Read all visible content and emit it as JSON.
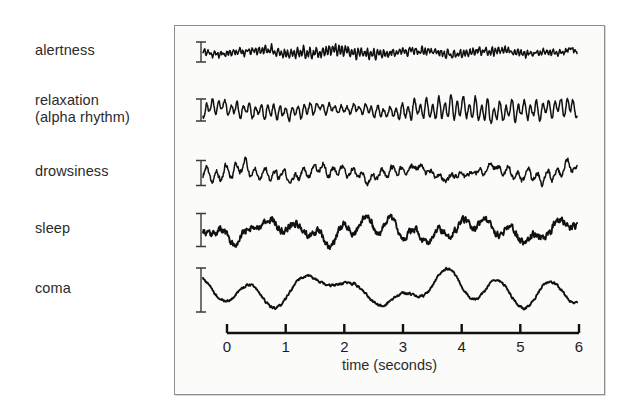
{
  "figure": {
    "background_color": "#ffffff",
    "panel_background_color": "#fbfbfa",
    "panel_border_color": "#8d8d8d",
    "trace_color": "#111111"
  },
  "axis": {
    "label": "time (seconds)",
    "tick_labels": [
      "0",
      "1",
      "2",
      "3",
      "4",
      "5",
      "6"
    ],
    "tick_values": [
      0,
      1,
      2,
      3,
      4,
      5,
      6
    ],
    "min": 0,
    "max": 6,
    "units": "seconds",
    "axis_color": "#111111"
  },
  "traces": [
    {
      "label": "alertness",
      "scale_bar_height_px": 20,
      "baseline_y": 52,
      "amplitude": 7,
      "frequency": 19.5,
      "noise": 0.55,
      "slow_amplitude": 1.6,
      "slow_frequency": 0.8,
      "seed": 11
    },
    {
      "label": "relaxation\n(alpha rhythm)",
      "scale_bar_height_px": 22,
      "baseline_y": 110,
      "amplitude": 17,
      "frequency": 10.2,
      "noise": 0.22,
      "slow_amplitude": 2.2,
      "slow_frequency": 0.55,
      "seed": 23
    },
    {
      "label": "drowsiness",
      "scale_bar_height_px": 25,
      "baseline_y": 173,
      "amplitude": 11,
      "frequency": 6.4,
      "noise": 0.45,
      "slow_amplitude": 4.5,
      "slow_frequency": 0.75,
      "seed": 37
    },
    {
      "label": "sleep",
      "scale_bar_height_px": 33,
      "baseline_y": 230,
      "amplitude": 15,
      "frequency": 2.6,
      "noise": 0.42,
      "slow_amplitude": 7,
      "slow_frequency": 0.62,
      "seed": 53
    },
    {
      "label": "coma",
      "scale_bar_height_px": 44,
      "baseline_y": 290,
      "amplitude": 23,
      "frequency": 1.25,
      "noise": 0.1,
      "slow_amplitude": 9,
      "slow_frequency": 0.45,
      "seed": 71
    }
  ],
  "chart_data": {
    "type": "line",
    "xlabel": "time (seconds)",
    "ylabel": "",
    "xlim": [
      0,
      6
    ],
    "grid": false,
    "legend_position": "left-labels",
    "x_tick_labels": [
      "0",
      "1",
      "2",
      "3",
      "4",
      "5",
      "6"
    ],
    "series": [
      {
        "name": "alertness",
        "description": "low-voltage fast beta activity, ~13-30 Hz",
        "dominant_frequency_hz": 19.5,
        "relative_amplitude": 1.0,
        "scale_bar_px": 20
      },
      {
        "name": "relaxation (alpha rhythm)",
        "description": "regular high-amplitude alpha waves, ~8-12 Hz",
        "dominant_frequency_hz": 10.2,
        "relative_amplitude": 2.4,
        "scale_bar_px": 22
      },
      {
        "name": "drowsiness",
        "description": "mixed theta activity, ~4-8 Hz",
        "dominant_frequency_hz": 6.4,
        "relative_amplitude": 1.6,
        "scale_bar_px": 25
      },
      {
        "name": "sleep",
        "description": "slow waves with spindles and K-complexes, ~1-4 Hz",
        "dominant_frequency_hz": 2.6,
        "relative_amplitude": 2.1,
        "scale_bar_px": 33
      },
      {
        "name": "coma",
        "description": "very slow high-amplitude delta waves, ~0.5-2 Hz",
        "dominant_frequency_hz": 1.25,
        "relative_amplitude": 3.3,
        "scale_bar_px": 44
      }
    ]
  }
}
